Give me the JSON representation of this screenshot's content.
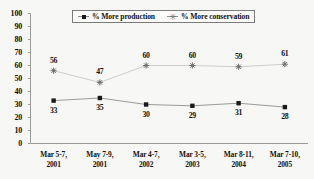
{
  "chart_data": {
    "type": "line",
    "title": "",
    "subtitle": "",
    "xlabel": "",
    "ylabel": "",
    "ylim": [
      0,
      100
    ],
    "ytick_step": 10,
    "yticks": [
      "100",
      "90",
      "80",
      "70",
      "60",
      "50",
      "40",
      "30",
      "20",
      "10",
      "0"
    ],
    "grid": false,
    "legend_position": "top-center",
    "categories": [
      "Mar 5-7,\n2001",
      "May 7-9,\n2001",
      "Mar 4-7,\n2002",
      "Mar 3-5,\n2003",
      "Mar 8-11,\n2004",
      "Mar 7-10,\n2005"
    ],
    "categories_lines": [
      [
        "Mar 5-7,",
        "2001"
      ],
      [
        "May 7-9,",
        "2001"
      ],
      [
        "Mar 4-7,",
        "2002"
      ],
      [
        "Mar 3-5,",
        "2003"
      ],
      [
        "Mar 8-11,",
        "2004"
      ],
      [
        "Mar 7-10,",
        "2005"
      ]
    ],
    "series": [
      {
        "name": "% More production",
        "marker": "filled-square",
        "color": "#1a1a1a",
        "line_color": "#9a9a9a",
        "values": [
          33,
          35,
          30,
          29,
          31,
          28
        ],
        "label_position": "below"
      },
      {
        "name": "% More conservation",
        "marker": "star",
        "color": "#6e6e6e",
        "line_color": "#cfcfcf",
        "values": [
          56,
          47,
          60,
          60,
          59,
          61
        ],
        "label_position": "above"
      }
    ]
  },
  "legend": {
    "items": [
      {
        "label": "% More production",
        "marker": "filled-square"
      },
      {
        "label": "% More conservation",
        "marker": "star"
      }
    ]
  },
  "colors": {
    "background": "#f7f7f5",
    "axis": "#9b9b9b",
    "text": "#111111",
    "production_marker": "#1a1a1a",
    "production_line": "#9a9a9a",
    "conservation_marker": "#6e6e6e",
    "conservation_line": "#cfcfcf"
  }
}
